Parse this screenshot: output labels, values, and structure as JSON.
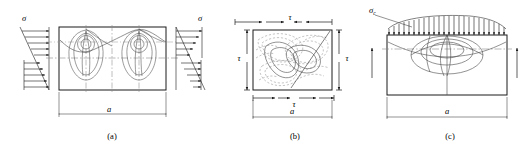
{
  "figure": {
    "panels": [
      {
        "id": "a",
        "caption": "(a)",
        "stress_symbol_left": "σ",
        "stress_symbol_right": "σ",
        "dimension_label": "a",
        "description": "Linear bending stress distribution with two lobe-shaped contour groups",
        "loading": "bending",
        "left_diagram": {
          "type": "linear-triangular",
          "top_arrows": 5,
          "bottom_arrows": 5,
          "top_direction": "right",
          "bottom_direction": "right"
        },
        "right_diagram": {
          "type": "linear-triangular",
          "top_arrows": 5,
          "bottom_arrows": 5,
          "top_direction": "right",
          "bottom_direction": "right"
        }
      },
      {
        "id": "b",
        "caption": "(b)",
        "stress_symbol_top": "τ",
        "stress_symbol_bottom": "τ",
        "stress_symbol_left": "τ",
        "stress_symbol_right": "τ",
        "dimension_label": "a",
        "description": "Pure shear loading with inclined dashed contour field",
        "loading": "shear"
      },
      {
        "id": "c",
        "caption": "(c)",
        "stress_symbol_top": "σ",
        "stress_symbol_top_subscript": "c",
        "dimension_label": "a",
        "description": "Parabolic distributed compressive load with concentric elliptical contours",
        "loading": "distributed-compression",
        "load_arrow_count": 21
      }
    ],
    "colors": {
      "stroke": "#1a1a1a",
      "contour": "#4a4a4a",
      "dashed": "#6a6a6a",
      "centerline": "#8a8a8a",
      "background": "#ffffff"
    }
  }
}
